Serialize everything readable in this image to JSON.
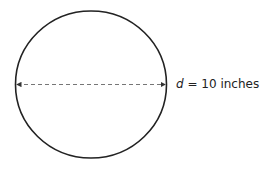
{
  "diagram": {
    "shape": "circle",
    "stroke_color": "#222222",
    "dimension_line": "dashed double-headed arrow across diameter",
    "label": {
      "variable": "d",
      "equals": " = ",
      "value": "10 inches"
    }
  }
}
